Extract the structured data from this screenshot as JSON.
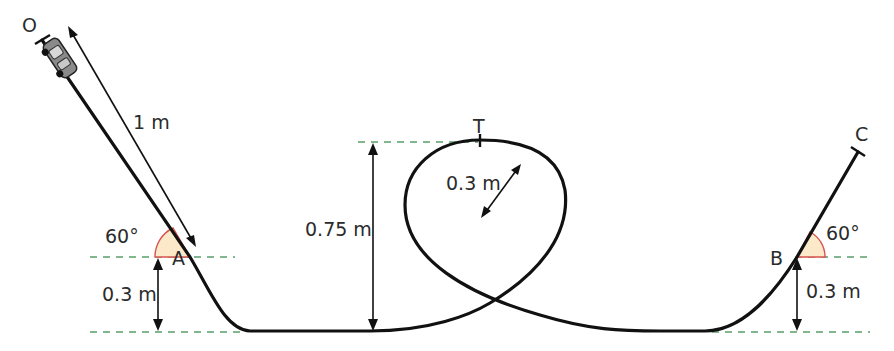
{
  "diagram": {
    "type": "physics-track",
    "points": {
      "start": "O",
      "left_base": "A",
      "loop_top": "T",
      "right_base": "B",
      "end": "C"
    },
    "labels": {
      "incline_length": "1 m",
      "left_angle": "60°",
      "right_angle": "60°",
      "height_A": "0.3 m",
      "height_B": "0.3 m",
      "loop_height": "0.75 m",
      "loop_radius": "0.3 m"
    },
    "colors": {
      "track": "#111111",
      "guide_lines": "#5a9e6a",
      "angle_fill": "#fbe9c9",
      "angle_stroke": "#d9534f",
      "car_body": "#8a8a8a"
    },
    "icons": {
      "car": "toy-car-icon"
    }
  }
}
